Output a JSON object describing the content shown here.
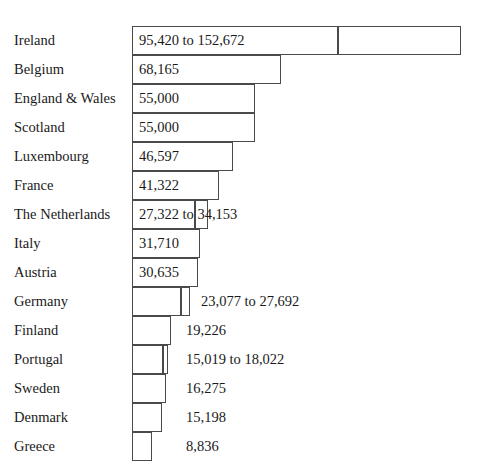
{
  "chart_data": {
    "type": "bar",
    "title": "",
    "subtitle": "",
    "xlabel": "",
    "ylabel": "",
    "orientation": "horizontal",
    "grid": false,
    "legend": false,
    "axis_visible": false,
    "value_axis_origin": 0,
    "categories": [
      "Ireland",
      "Belgium",
      "England & Wales",
      "Scotland",
      "Luxembourg",
      "France",
      "The Netherlands",
      "Italy",
      "Austria",
      "Germany",
      "Finland",
      "Portugal",
      "Sweden",
      "Denmark",
      "Greece"
    ],
    "values": [
      152672,
      68165,
      55000,
      55000,
      46597,
      41322,
      34153,
      31710,
      30635,
      27692,
      19226,
      18022,
      16275,
      15198,
      8836
    ],
    "range_low": [
      95420,
      null,
      null,
      null,
      null,
      null,
      27322,
      null,
      null,
      23077,
      null,
      15019,
      null,
      null,
      null
    ],
    "labels": [
      "95,420 to 152,672",
      "68,165",
      "55,000",
      "55,000",
      "46,597",
      "41,322",
      "27,322 to 34,153",
      "31,710",
      "30,635",
      "23,077 to 27,692",
      "19,226",
      "15,019 to 18,022",
      "16,275",
      "15,198",
      "8,836"
    ],
    "label_position": [
      "inside",
      "inside",
      "inside",
      "inside",
      "inside",
      "inside",
      "inside",
      "inside",
      "inside",
      "outside",
      "outside",
      "outside",
      "outside",
      "outside",
      "outside"
    ],
    "colors": {
      "bar_fill": "#ffffff",
      "bar_border": "#4a4a4a",
      "text": "#1a1a1a",
      "background": "#ffffff"
    }
  },
  "geometry": {
    "bar_left_px": 132,
    "row_height_px": 29,
    "first_row_top_px": 26,
    "rows": [
      {
        "main_end": 338,
        "ext_end": 461,
        "label_x": 139
      },
      {
        "main_end": 281,
        "ext_end": null,
        "label_x": 139
      },
      {
        "main_end": 255,
        "ext_end": null,
        "label_x": 139
      },
      {
        "main_end": 255,
        "ext_end": null,
        "label_x": 139
      },
      {
        "main_end": 233,
        "ext_end": null,
        "label_x": 139
      },
      {
        "main_end": 219,
        "ext_end": null,
        "label_x": 139
      },
      {
        "main_end": 195,
        "ext_end": 208,
        "label_x": 139
      },
      {
        "main_end": 200,
        "ext_end": null,
        "label_x": 139
      },
      {
        "main_end": 198,
        "ext_end": null,
        "label_x": 139
      },
      {
        "main_end": 181,
        "ext_end": 190,
        "label_x": 201
      },
      {
        "main_end": 171,
        "ext_end": null,
        "label_x": 186
      },
      {
        "main_end": 163,
        "ext_end": 168,
        "label_x": 186
      },
      {
        "main_end": 166,
        "ext_end": null,
        "label_x": 186
      },
      {
        "main_end": 162,
        "ext_end": null,
        "label_x": 186
      },
      {
        "main_end": 152,
        "ext_end": null,
        "label_x": 186
      }
    ]
  }
}
